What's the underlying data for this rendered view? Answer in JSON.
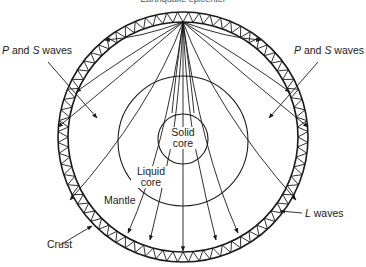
{
  "title": "Earthquake epicenter",
  "labels": {
    "p_s_left": {
      "italic1": "P",
      "mid": " and ",
      "italic2": "S",
      "rest": " waves"
    },
    "p_s_right": {
      "italic1": "P",
      "mid": " and ",
      "italic2": "S",
      "rest": " waves"
    },
    "solid_core_line1": "Solid",
    "solid_core_line2": "core",
    "liquid_core_line1": "Liquid",
    "liquid_core_line2": "core",
    "mantle": "Mantle",
    "crust": "Crust",
    "l_waves": {
      "italic1": "L",
      "rest": " waves"
    }
  },
  "geometry": {
    "earth_center": [
      183,
      137
    ],
    "crust_outer_radius": 125,
    "crust_inner_radius": 115,
    "liquid_core_center": [
      183,
      141
    ],
    "liquid_core_radius": 65,
    "solid_core_center": [
      183,
      139
    ],
    "solid_core_radius": 25,
    "epicenter": [
      183,
      22
    ]
  },
  "colors": {
    "stroke": "#1a1a1a",
    "background": "#ffffff"
  }
}
